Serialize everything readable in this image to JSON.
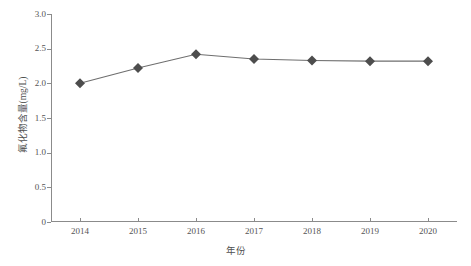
{
  "chart_data": {
    "type": "line",
    "title": "",
    "xlabel": "年份",
    "ylabel": "氟化物含量(mg/L)",
    "categories": [
      "2014",
      "2015",
      "2016",
      "2017",
      "2018",
      "2019",
      "2020"
    ],
    "values": [
      2.0,
      2.22,
      2.42,
      2.35,
      2.33,
      2.32,
      2.32
    ],
    "series": [
      {
        "name": "氟化物含量",
        "values": [
          2.0,
          2.22,
          2.42,
          2.35,
          2.33,
          2.32,
          2.32
        ]
      }
    ],
    "ylim": [
      0,
      3.0
    ],
    "y_ticks": [
      "0",
      "0.5",
      "1.0",
      "1.5",
      "2.0",
      "2.5",
      "3.0"
    ],
    "y_tick_values": [
      0,
      0.5,
      1.0,
      1.5,
      2.0,
      2.5,
      3.0
    ],
    "grid": false,
    "legend": false,
    "legend_position": "none",
    "marker": "diamond",
    "marker_color": "#4d4d4d",
    "line_color": "#6e6e6e",
    "axis_color": "#8b8b8b"
  },
  "axes": {
    "y_title": "氟化物含量(mg/L)",
    "x_title": "年份"
  }
}
